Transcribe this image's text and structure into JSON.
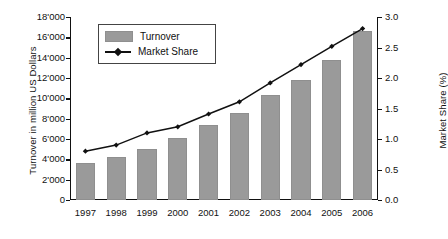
{
  "chart_data": {
    "type": "bar",
    "title": "",
    "subtitle": "",
    "xlabel": "",
    "ylabel": "Turnover in million US Dollars",
    "y2label": "Market Share (%)",
    "categories": [
      "1997",
      "1998",
      "1999",
      "2000",
      "2001",
      "2002",
      "2003",
      "2004",
      "2005",
      "2006"
    ],
    "ylim": [
      0,
      18000
    ],
    "y2lim": [
      0,
      3.0
    ],
    "yticks": [
      "0",
      "2'000",
      "4'000",
      "6'000",
      "8'000",
      "10'000",
      "12'000",
      "14'000",
      "16'000",
      "18'000"
    ],
    "ytick_values": [
      0,
      2000,
      4000,
      6000,
      8000,
      10000,
      12000,
      14000,
      16000,
      18000
    ],
    "y2ticks": [
      "0.0",
      "0.5",
      "1.0",
      "1.5",
      "2.0",
      "2.5",
      "3.0"
    ],
    "y2tick_values": [
      0,
      0.5,
      1.0,
      1.5,
      2.0,
      2.5,
      3.0
    ],
    "grid": false,
    "legend_position": "top-left",
    "series": [
      {
        "name": "Turnover",
        "type": "bar",
        "axis": "left",
        "color": "#9a9a9a",
        "values": [
          3600,
          4250,
          5000,
          6050,
          7350,
          8550,
          10300,
          11850,
          13800,
          16650
        ]
      },
      {
        "name": "Market Share",
        "type": "line",
        "axis": "right",
        "color": "#111111",
        "marker": "diamond",
        "values": [
          0.8,
          0.9,
          1.1,
          1.2,
          1.41,
          1.61,
          1.92,
          2.22,
          2.52,
          2.81
        ]
      }
    ]
  },
  "legend": {
    "items": [
      {
        "label": "Turnover",
        "marker": "swatch"
      },
      {
        "label": "Market Share",
        "marker": "line-diamond"
      }
    ]
  },
  "colors": {
    "bar": "#9a9a9a",
    "line": "#111111",
    "axis": "#111111",
    "background": "#ffffff"
  }
}
